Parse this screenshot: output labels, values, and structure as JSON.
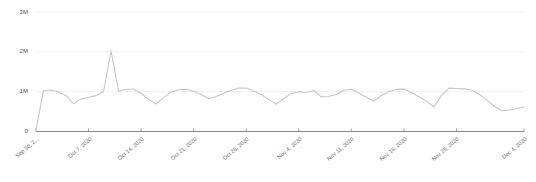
{
  "chart_data": {
    "type": "line",
    "title": "",
    "subtitle": "",
    "xlabel": "",
    "ylabel": "",
    "ylim": [
      0,
      3000000
    ],
    "grid": true,
    "legend": null,
    "y_ticks": [
      {
        "value": 0,
        "label": "0"
      },
      {
        "value": 1000000,
        "label": "1M"
      },
      {
        "value": 2000000,
        "label": "2M"
      },
      {
        "value": 3000000,
        "label": "3M"
      }
    ],
    "x_ticks": [
      {
        "index": 0,
        "label": "Sep 30, 2..."
      },
      {
        "index": 7,
        "label": "Oct 7, 2020"
      },
      {
        "index": 14,
        "label": "Oct 14, 2020"
      },
      {
        "index": 21,
        "label": "Oct 21, 2020"
      },
      {
        "index": 28,
        "label": "Oct 28, 2020"
      },
      {
        "index": 35,
        "label": "Nov 4, 2020"
      },
      {
        "index": 42,
        "label": "Nov 11, 2020"
      },
      {
        "index": 49,
        "label": "Nov 18, 2020"
      },
      {
        "index": 56,
        "label": "Nov 25, 2020"
      },
      {
        "index": 65,
        "label": "Dec 4, 2020"
      }
    ],
    "series": [
      {
        "name": "views",
        "color": "#c8c8c8",
        "x": [
          0,
          1,
          2,
          3,
          4,
          5,
          6,
          7,
          8,
          9,
          10,
          11,
          12,
          13,
          14,
          15,
          16,
          17,
          18,
          19,
          20,
          21,
          22,
          23,
          24,
          25,
          26,
          27,
          28,
          29,
          30,
          31,
          32,
          33,
          34,
          35,
          36,
          37,
          38,
          39,
          40,
          41,
          42,
          43,
          44,
          45,
          46,
          47,
          48,
          49,
          50,
          51,
          52,
          53,
          54,
          55,
          56,
          57,
          58,
          59,
          60,
          61,
          62,
          63,
          64,
          65
        ],
        "values": [
          40000,
          1030000,
          1040000,
          990000,
          900000,
          700000,
          820000,
          860000,
          900000,
          1010000,
          2020000,
          1010000,
          1060000,
          1060000,
          960000,
          800000,
          690000,
          850000,
          990000,
          1050000,
          1060000,
          1010000,
          930000,
          820000,
          880000,
          960000,
          1030000,
          1090000,
          1090000,
          1010000,
          930000,
          800000,
          690000,
          830000,
          950000,
          1000000,
          980000,
          1030000,
          870000,
          880000,
          930000,
          1040000,
          1060000,
          960000,
          860000,
          760000,
          900000,
          1000000,
          1060000,
          1070000,
          980000,
          870000,
          760000,
          620000,
          900000,
          1090000,
          1080000,
          1070000,
          1040000,
          940000,
          800000,
          640000,
          520000,
          540000,
          570000,
          620000
        ]
      }
    ],
    "annotations": [
      {
        "x": 10,
        "y": 2020000,
        "note": "peak"
      }
    ]
  },
  "axis": {
    "axis_line_color": "#8a8a8a",
    "gridline_color": "#f0f0f0",
    "tick_color": "#9a9a9a",
    "label_color": "#6a6a6a"
  }
}
